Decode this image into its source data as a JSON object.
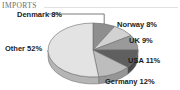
{
  "header": {
    "title": "IMPORTS"
  },
  "chart_data": {
    "type": "pie",
    "title": "IMPORTS",
    "xlabel": "",
    "ylabel": "",
    "three_d": true,
    "start_angle_deg": 0,
    "direction": "clockwise",
    "legend_position": "none",
    "labels_inline": true,
    "categories": [
      "Denmark",
      "Norway",
      "UK",
      "USA",
      "Germany",
      "Other"
    ],
    "values": [
      8,
      8,
      9,
      11,
      12,
      52
    ],
    "unit": "%",
    "slices": [
      {
        "name": "Denmark",
        "value": 8,
        "label": "Denmark 8%",
        "color": "#8e8e8e",
        "side_color": "#6f6f6f",
        "leader_line": true
      },
      {
        "name": "Norway",
        "value": 8,
        "label": "Norway 8%",
        "color": "#d2d2d2",
        "side_color": "#a9a9a9",
        "leader_line": false
      },
      {
        "name": "UK",
        "value": 9,
        "label": "UK 9%",
        "color": "#9a9a9a",
        "side_color": "#7a7a7a",
        "leader_line": false
      },
      {
        "name": "USA",
        "value": 11,
        "label": "USA 11%",
        "color": "#5f5f5f",
        "side_color": "#4a4a4a",
        "leader_line": false
      },
      {
        "name": "Germany",
        "value": 12,
        "label": "Germany 12%",
        "color": "#bdbdbd",
        "side_color": "#969696",
        "leader_line": false
      },
      {
        "name": "Other",
        "value": 52,
        "label": "Other 52%",
        "color": "#e3e3e3",
        "side_color": "#b5b5b5",
        "leader_line": false
      }
    ],
    "colors": {
      "background": "#ffffff",
      "outline": "#6b6b6b",
      "label_text": "#1b1b1b",
      "title_text": "#6d6d6d",
      "rule": "#e2e2e2"
    }
  }
}
